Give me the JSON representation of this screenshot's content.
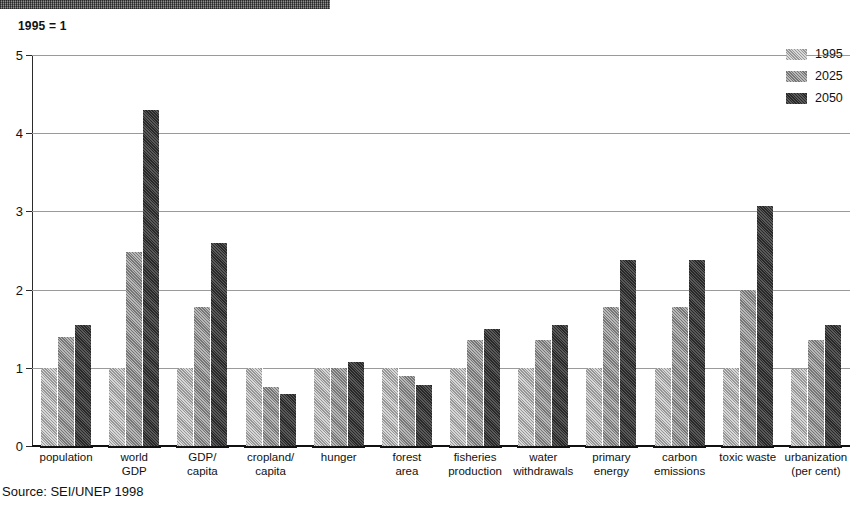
{
  "subtitle": "1995 = 1",
  "source": "Source: SEI/UNEP 1998",
  "legend": {
    "items": [
      {
        "label": "1995",
        "color": "#a8a8a8",
        "series_key": "s1995"
      },
      {
        "label": "2025",
        "color": "#8d8d8d",
        "series_key": "s2025"
      },
      {
        "label": "2050",
        "color": "#3a3a3a",
        "series_key": "s2050"
      }
    ]
  },
  "chart_data": {
    "type": "bar",
    "title": "",
    "subtitle": "1995 = 1",
    "xlabel": "",
    "ylabel": "",
    "ylim": [
      0,
      5
    ],
    "yticks": [
      0,
      1,
      2,
      3,
      4,
      5
    ],
    "grid": true,
    "legend_position": "right-top",
    "source": "Source: SEI/UNEP 1998",
    "categories": [
      "population",
      "world\nGDP",
      "GDP/\ncapita",
      "cropland/\ncapita",
      "hunger",
      "forest\narea",
      "fisheries\nproduction",
      "water\nwithdrawals",
      "primary\nenergy",
      "carbon\nemissions",
      "toxic waste",
      "urbanization\n(per cent)"
    ],
    "series": [
      {
        "name": "1995",
        "color": "#a8a8a8",
        "values": [
          1.0,
          1.0,
          1.0,
          1.0,
          1.0,
          1.0,
          1.0,
          1.0,
          1.0,
          1.0,
          1.0,
          0.98
        ]
      },
      {
        "name": "2025",
        "color": "#8d8d8d",
        "values": [
          1.4,
          2.48,
          1.78,
          0.75,
          1.0,
          0.9,
          1.36,
          1.36,
          1.78,
          1.78,
          2.0,
          1.35
        ]
      },
      {
        "name": "2050",
        "color": "#3a3a3a",
        "values": [
          1.55,
          4.3,
          2.6,
          0.67,
          1.07,
          0.78,
          1.5,
          1.55,
          2.38,
          2.38,
          3.07,
          1.55
        ]
      }
    ]
  }
}
